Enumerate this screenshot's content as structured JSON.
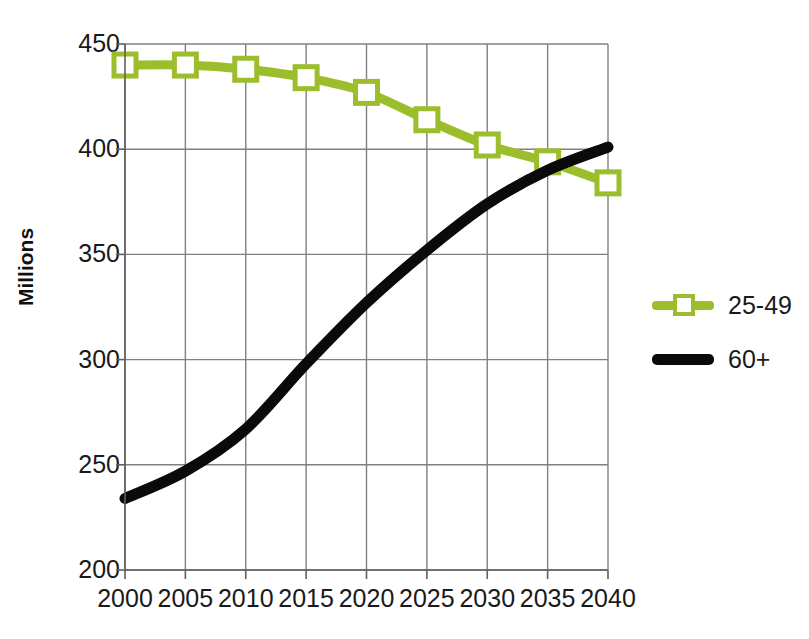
{
  "chart_data": {
    "type": "line",
    "title": "",
    "xlabel": "",
    "ylabel": "Millions",
    "categories": [
      "2000",
      "2005",
      "2010",
      "2015",
      "2020",
      "2025",
      "2030",
      "2035",
      "2040"
    ],
    "x": [
      2000,
      2005,
      2010,
      2015,
      2020,
      2025,
      2030,
      2035,
      2040
    ],
    "xlim": [
      2000,
      2040
    ],
    "ylim": [
      200,
      450
    ],
    "yticks": [
      200,
      250,
      300,
      350,
      400,
      450
    ],
    "xticks": [
      2000,
      2005,
      2010,
      2015,
      2020,
      2025,
      2030,
      2035,
      2040
    ],
    "grid": true,
    "legend_position": "right",
    "series": [
      {
        "name": "25-49",
        "color": "#9DBE2C",
        "marker": "square-open",
        "values": [
          440,
          440,
          438,
          434,
          427,
          414,
          402,
          394,
          384
        ]
      },
      {
        "name": "60+",
        "color": "#0A0A0A",
        "marker": "none",
        "values": [
          234,
          247,
          267,
          298,
          327,
          352,
          374,
          390,
          401
        ]
      }
    ]
  },
  "axis": {
    "y_title": "Millions",
    "y_tick_labels": [
      "450",
      "400",
      "350",
      "300",
      "250",
      "200"
    ],
    "x_tick_labels": [
      "2000",
      "2005",
      "2010",
      "2015",
      "2020",
      "2025",
      "2030",
      "2035",
      "2040"
    ]
  },
  "legend": {
    "entries": [
      {
        "label": "25-49",
        "color": "#9DBE2C"
      },
      {
        "label": "60+",
        "color": "#0A0A0A"
      }
    ]
  },
  "colors": {
    "series_green": "#9DBE2C",
    "series_black": "#0A0A0A",
    "grid": "#808080",
    "axis": "#606060",
    "text": "#1A1A1A",
    "background": "#FFFFFF"
  }
}
